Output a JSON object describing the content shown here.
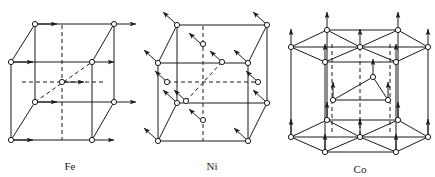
{
  "figure": {
    "background_color": "#ffffff",
    "line_color": "#1a1a1a",
    "atom_fill": "#ffffff"
  },
  "panels": [
    {
      "id": "fe",
      "label": "Fe",
      "lattice": "bcc",
      "arrow_direction": "right",
      "arrow_glyph": "→",
      "atom_count": 9,
      "origin": [
        11,
        24
      ],
      "cube": {
        "front_top_left": [
          11,
          62
        ],
        "front_top_right": [
          92,
          62
        ],
        "front_bottom_left": [
          11,
          140
        ],
        "front_bottom_right": [
          92,
          140
        ],
        "back_top_left": [
          35,
          24
        ],
        "back_top_right": [
          114,
          24
        ],
        "back_bottom_left": [
          35,
          102
        ],
        "back_bottom_right": [
          114,
          102
        ],
        "body_center": [
          62,
          82
        ]
      }
    },
    {
      "id": "ni",
      "label": "Ni",
      "lattice": "fcc",
      "arrow_direction": "up-left",
      "arrow_glyph": "↖",
      "atom_count": 14,
      "cube": {
        "front_top_left": [
          158,
          63
        ],
        "front_top_right": [
          248,
          63
        ],
        "front_bottom_left": [
          158,
          141
        ],
        "front_bottom_right": [
          248,
          141
        ],
        "back_top_left": [
          177,
          25
        ],
        "back_top_right": [
          267,
          25
        ],
        "back_bottom_left": [
          177,
          103
        ],
        "back_bottom_right": [
          267,
          103
        ]
      }
    },
    {
      "id": "co",
      "label": "Co",
      "lattice": "hcp",
      "arrow_direction": "up",
      "arrow_glyph": "↑",
      "atom_count": 17,
      "hex_top_y": 38,
      "hex_bottom_y": 128,
      "mid_layer_y": 83
    }
  ],
  "captions": {
    "fe": "Fe",
    "ni": "Ni",
    "co": "Co"
  }
}
